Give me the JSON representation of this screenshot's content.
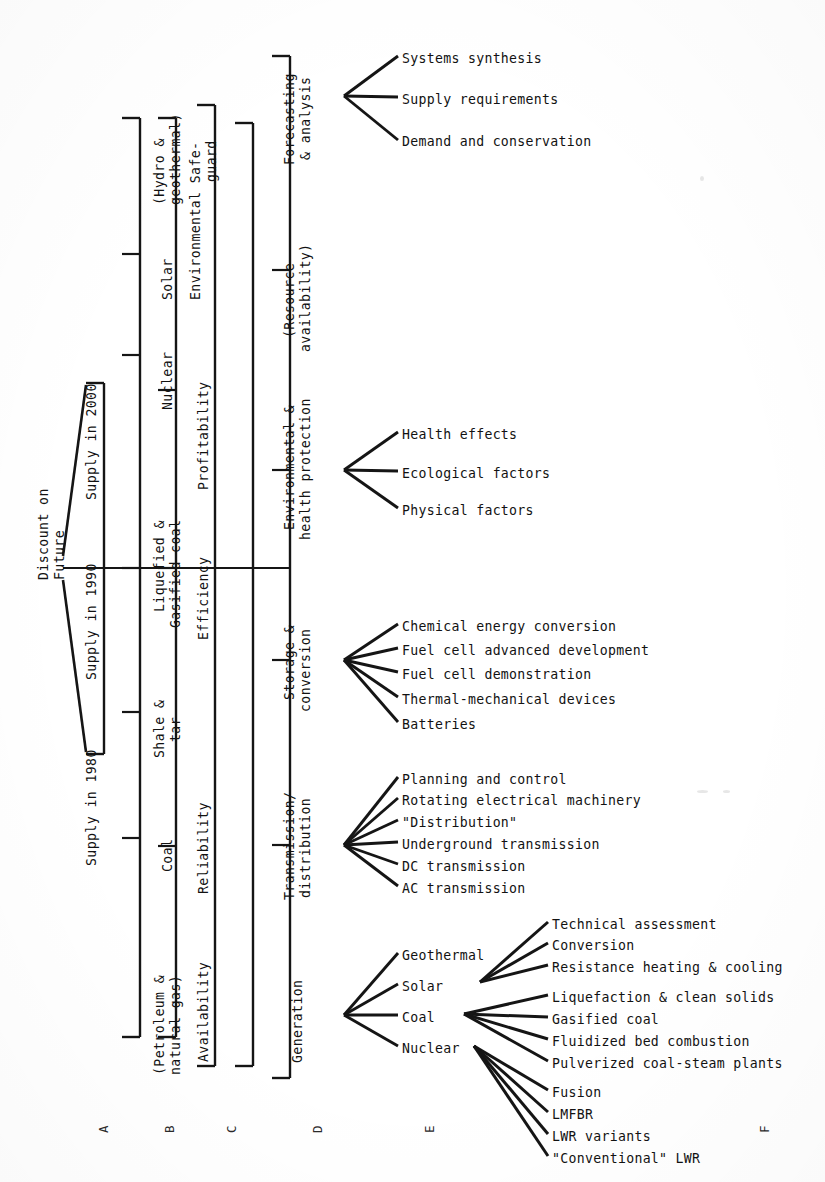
{
  "diagram": {
    "type": "hierarchical-tree",
    "orientation": "rotated-90-ccw",
    "column_keys": [
      {
        "key": "A",
        "x": 96
      },
      {
        "key": "B",
        "x": 162
      },
      {
        "key": "C",
        "x": 224
      },
      {
        "key": "D",
        "x": 310
      },
      {
        "key": "E",
        "x": 422
      },
      {
        "key": "F",
        "x": 757
      }
    ]
  },
  "column_a": {
    "root": "Discount on\nFuture",
    "root_line1": "Discount on",
    "root_line2": "Future",
    "children": [
      "Supply in 2000",
      "Supply in 1990",
      "Supply in 1980"
    ]
  },
  "column_b": {
    "items": [
      {
        "line1": "(Hydro &",
        "line2": "geothermal)"
      },
      {
        "line1": "Solar",
        "line2": ""
      },
      {
        "line1": "Nuclear",
        "line2": ""
      },
      {
        "line1": "Liquefied &",
        "line2": "Gasified coal"
      },
      {
        "line1": "Shale &",
        "line2": "tar"
      },
      {
        "line1": "Coal",
        "line2": ""
      },
      {
        "line1": "(Petroleum &",
        "line2": "natural gas)"
      }
    ]
  },
  "column_c": {
    "items": [
      {
        "line1": "Environmental Safe-",
        "line2": "guard"
      },
      {
        "line1": "Profitability",
        "line2": ""
      },
      {
        "line1": "Efficiency",
        "line2": ""
      },
      {
        "line1": "Reliability",
        "line2": ""
      },
      {
        "line1": "Availability",
        "line2": ""
      }
    ]
  },
  "column_d": {
    "items": [
      {
        "line1": "Forecasting",
        "line2": "& analysis"
      },
      {
        "line1": "(Resource",
        "line2": "availability)"
      },
      {
        "line1": "Environmental &",
        "line2": "health protection"
      },
      {
        "line1": "Storage &",
        "line2": "conversion"
      },
      {
        "line1": "Transmission/",
        "line2": "distribution"
      },
      {
        "line1": "Generation",
        "line2": ""
      }
    ]
  },
  "branches": {
    "forecasting": {
      "parent": "Forecasting & analysis",
      "children": [
        "Systems synthesis",
        "Supply requirements",
        "Demand and conservation"
      ]
    },
    "environmental_health": {
      "parent": "Environmental & health protection",
      "children": [
        "Health effects",
        "Ecological factors",
        "Physical factors"
      ]
    },
    "storage_conversion": {
      "parent": "Storage & conversion",
      "children": [
        "Chemical energy conversion",
        "Fuel cell advanced development",
        "Fuel cell demonstration",
        "Thermal-mechanical devices",
        "Batteries"
      ]
    },
    "transmission_distribution": {
      "parent": "Transmission/distribution",
      "children": [
        "Planning and control",
        "Rotating electrical machinery",
        "\"Distribution\"",
        "Underground transmission",
        "DC transmission",
        "AC transmission"
      ]
    },
    "generation": {
      "parent": "Generation",
      "children": [
        "Geothermal",
        "Solar",
        "Coal",
        "Nuclear"
      ]
    },
    "solar_sub": {
      "parent": "Solar",
      "children": [
        "Technical assessment",
        "Conversion",
        "Resistance heating & cooling"
      ]
    },
    "coal_sub": {
      "parent": "Coal",
      "children": [
        "Liquefaction & clean solids",
        "Gasified coal",
        "Fluidized bed combustion",
        "Pulverized coal-steam plants"
      ]
    },
    "nuclear_sub": {
      "parent": "Nuclear",
      "children": [
        "Fusion",
        "LMFBR",
        "LWR variants",
        "\"Conventional\" LWR"
      ]
    }
  }
}
